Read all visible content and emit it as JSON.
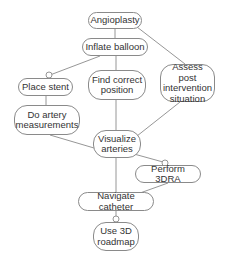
{
  "diagram": {
    "type": "task-hierarchy",
    "nodes": [
      {
        "id": "angioplasty",
        "label": "Angioplasty",
        "x": 88,
        "y": 12,
        "w": 54,
        "h": 17
      },
      {
        "id": "inflate",
        "label": "Inflate balloon",
        "x": 82,
        "y": 38,
        "w": 66,
        "h": 18
      },
      {
        "id": "place_stent",
        "label": "Place stent",
        "x": 18,
        "y": 78,
        "w": 55,
        "h": 18
      },
      {
        "id": "find_position",
        "label": "Find correct\nposition",
        "x": 88,
        "y": 70,
        "w": 58,
        "h": 30
      },
      {
        "id": "assess",
        "label": "Assess post\nintervention\nsituation",
        "x": 160,
        "y": 64,
        "w": 55,
        "h": 38
      },
      {
        "id": "measure",
        "label": "Do artery\nmeasurements",
        "x": 14,
        "y": 105,
        "w": 66,
        "h": 30
      },
      {
        "id": "visualize",
        "label": "Visualize\narteries",
        "x": 93,
        "y": 130,
        "w": 48,
        "h": 28
      },
      {
        "id": "perform_3dra",
        "label": "Perform 3DRA",
        "x": 135,
        "y": 165,
        "w": 66,
        "h": 18
      },
      {
        "id": "navigate",
        "label": "Navigate catheter",
        "x": 78,
        "y": 192,
        "w": 76,
        "h": 19
      },
      {
        "id": "roadmap",
        "label": "Use 3D\nroadmap",
        "x": 93,
        "y": 222,
        "w": 46,
        "h": 29
      }
    ],
    "edges": [
      {
        "from": "angioplasty",
        "to": "inflate",
        "optional": false
      },
      {
        "from": "angioplasty",
        "to": "assess",
        "optional": false
      },
      {
        "from": "inflate",
        "to": "place_stent",
        "optional": true
      },
      {
        "from": "inflate",
        "to": "find_position",
        "optional": false
      },
      {
        "from": "place_stent",
        "to": "measure",
        "optional": false
      },
      {
        "from": "measure",
        "to": "visualize",
        "optional": false
      },
      {
        "from": "find_position",
        "to": "visualize",
        "optional": false
      },
      {
        "from": "assess",
        "to": "visualize",
        "optional": false
      },
      {
        "from": "visualize",
        "to": "perform_3dra",
        "optional": true
      },
      {
        "from": "visualize",
        "to": "navigate",
        "optional": false
      },
      {
        "from": "perform_3dra",
        "to": "navigate",
        "optional": false
      },
      {
        "from": "navigate",
        "to": "roadmap",
        "optional": true
      }
    ],
    "colors": {
      "line": "#8a8a8a",
      "border": "#8a8a8a",
      "text": "#333333",
      "background": "#ffffff"
    }
  }
}
